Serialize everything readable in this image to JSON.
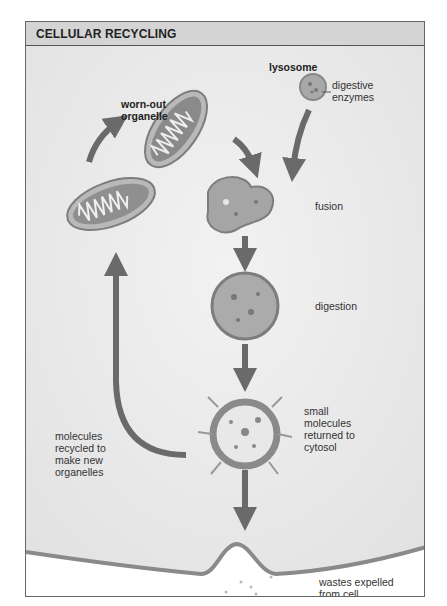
{
  "figure": {
    "title": "CELLULAR RECYCLING",
    "labels": {
      "worn_out_1": "worn-out",
      "worn_out_2": "organelle",
      "lysosome": "lysosome",
      "digestive_1": "digestive",
      "digestive_2": "enzymes",
      "fusion": "fusion",
      "digestion": "digestion",
      "small_1": "small",
      "small_2": "molecules",
      "small_3": "returned to",
      "small_4": "cytosol",
      "recycled_1": "molecules",
      "recycled_2": "recycled to",
      "recycled_3": "make new",
      "recycled_4": "organelles",
      "wastes_1": "wastes expelled",
      "wastes_2": "from cell"
    },
    "colors": {
      "header_bg": "#d4d4d4",
      "background": "#ececec",
      "arrow": "#6a6a6a",
      "membrane": "#8a8a8a"
    }
  }
}
